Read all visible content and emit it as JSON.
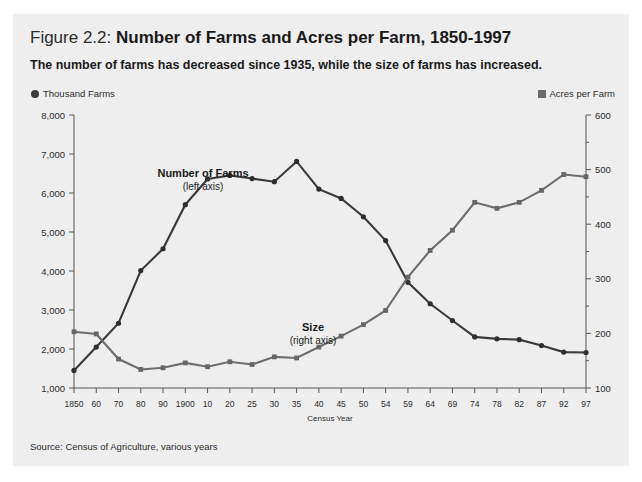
{
  "figure": {
    "label": "Figure 2.2:",
    "title": "Number of Farms and Acres per Farm, 1850-1997",
    "subtitle": "The number of farms has decreased since 1935, while the size of farms has increased.",
    "source": "Source: Census of Agriculture, various years",
    "background_color": "#eeeeee"
  },
  "legend": {
    "left": {
      "marker": "filled-circle-marker",
      "label": "Thousand Farms",
      "color": "#3b3b3b"
    },
    "right": {
      "marker": "filled-square-marker",
      "label": "Acres per Farm",
      "color": "#6b6b6b"
    }
  },
  "annotations": {
    "farms_label": "Number of Farms",
    "farms_sub": "(left axis)",
    "size_label": "Size",
    "size_sub": "(right axis)"
  },
  "chart_data": {
    "type": "line",
    "title": "Number of Farms and Acres per Farm, 1850-1997",
    "xlabel": "Census Year",
    "categories": [
      "1850",
      "60",
      "70",
      "80",
      "90",
      "1900",
      "10",
      "20",
      "25",
      "30",
      "35",
      "40",
      "45",
      "50",
      "54",
      "59",
      "64",
      "69",
      "74",
      "78",
      "82",
      "87",
      "92",
      "97"
    ],
    "y_left": {
      "label": "Thousand Farms",
      "ticks": [
        "1,000",
        "2,000",
        "3,000",
        "4,000",
        "5,000",
        "6,000",
        "7,000",
        "8,000"
      ],
      "tickvalues": [
        1000,
        2000,
        3000,
        4000,
        5000,
        6000,
        7000,
        8000
      ],
      "ylim": [
        1000,
        8000
      ]
    },
    "y_right": {
      "label": "Acres per Farm",
      "ticks": [
        "100",
        "200",
        "300",
        "400",
        "500",
        "600"
      ],
      "tickvalues": [
        100,
        200,
        300,
        400,
        500,
        600
      ],
      "minor_step": 50,
      "ylim": [
        100,
        600
      ]
    },
    "grid": false,
    "legend_position": "top-outside",
    "series": [
      {
        "name": "Number of Farms",
        "axis": "left",
        "units": "thousand farms",
        "color": "#2e2e2e",
        "marker": "circle",
        "values": [
          1450,
          2050,
          2660,
          4010,
          4570,
          5700,
          6360,
          6450,
          6370,
          6290,
          6810,
          6100,
          5860,
          5390,
          4780,
          3710,
          3160,
          2730,
          2310,
          2260,
          2240,
          2090,
          1920,
          1910
        ]
      },
      {
        "name": "Acres per Farm (Size)",
        "axis": "right",
        "units": "acres",
        "color": "#666666",
        "marker": "square",
        "values": [
          203,
          199,
          153,
          134,
          137,
          146,
          139,
          148,
          143,
          157,
          155,
          175,
          195,
          216,
          242,
          303,
          352,
          389,
          440,
          429,
          440,
          462,
          491,
          487
        ]
      }
    ]
  }
}
